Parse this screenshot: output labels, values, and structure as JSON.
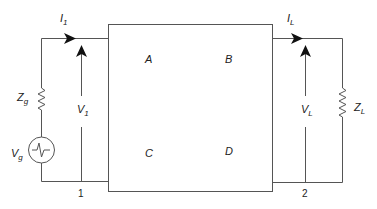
{
  "diagram": {
    "type": "two-port network circuit",
    "box": {
      "params": {
        "a": "A",
        "b": "B",
        "c": "C",
        "d": "D"
      }
    },
    "input": {
      "current": {
        "main": "I",
        "sub": "1"
      },
      "voltage": {
        "main": "V",
        "sub": "1"
      },
      "source_impedance": {
        "main": "Z",
        "sub": "g"
      },
      "source_voltage": {
        "main": "V",
        "sub": "g"
      },
      "port_number": "1"
    },
    "output": {
      "current": {
        "main": "I",
        "sub": "L"
      },
      "voltage": {
        "main": "V",
        "sub": "L"
      },
      "load_impedance": {
        "main": "Z",
        "sub": "L"
      },
      "port_number": "2"
    },
    "colors": {
      "line": "#555555",
      "text": "#222222",
      "background": "#ffffff"
    }
  }
}
